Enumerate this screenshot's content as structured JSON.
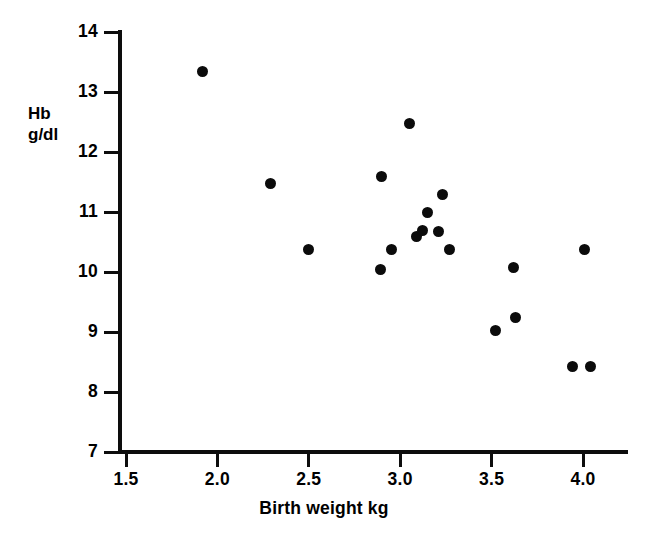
{
  "chart_data": {
    "type": "scatter",
    "title": "",
    "xlabel": "Birth weight kg",
    "ylabel": "Hb\ng/dl",
    "ylabel_lines": [
      "Hb",
      "g/dl"
    ],
    "xlim": [
      1.5,
      4.15
    ],
    "ylim": [
      7,
      14
    ],
    "xticks": [
      1.5,
      2.0,
      2.5,
      3.0,
      3.5,
      4.0
    ],
    "xtick_labels": [
      "1.5",
      "2.0",
      "2.5",
      "3.0",
      "3.5",
      "4.0"
    ],
    "yticks": [
      7,
      8,
      9,
      10,
      11,
      12,
      13,
      14
    ],
    "ytick_labels": [
      "7",
      "8",
      "9",
      "10",
      "11",
      "12",
      "13",
      "14"
    ],
    "grid": false,
    "legend": null,
    "marker": "filled-circle",
    "marker_color": "#0b0b0b",
    "x": [
      1.92,
      2.29,
      2.5,
      2.9,
      2.89,
      2.95,
      3.05,
      3.09,
      3.12,
      3.15,
      3.21,
      3.23,
      3.27,
      3.52,
      3.62,
      3.63,
      3.94,
      4.01,
      4.04
    ],
    "y": [
      13.35,
      11.47,
      10.37,
      11.6,
      10.05,
      10.37,
      12.48,
      10.6,
      10.7,
      11.0,
      10.68,
      11.3,
      10.37,
      9.02,
      10.07,
      9.25,
      8.42,
      10.37,
      8.42
    ],
    "points": [
      {
        "x": 1.92,
        "y": 13.35
      },
      {
        "x": 2.29,
        "y": 11.47
      },
      {
        "x": 2.5,
        "y": 10.37
      },
      {
        "x": 2.9,
        "y": 11.6
      },
      {
        "x": 2.89,
        "y": 10.05
      },
      {
        "x": 2.95,
        "y": 10.37
      },
      {
        "x": 3.05,
        "y": 12.48
      },
      {
        "x": 3.09,
        "y": 10.6
      },
      {
        "x": 3.12,
        "y": 10.7
      },
      {
        "x": 3.15,
        "y": 11.0
      },
      {
        "x": 3.21,
        "y": 10.68
      },
      {
        "x": 3.23,
        "y": 11.3
      },
      {
        "x": 3.27,
        "y": 10.37
      },
      {
        "x": 3.52,
        "y": 9.02
      },
      {
        "x": 3.62,
        "y": 10.07
      },
      {
        "x": 3.63,
        "y": 9.25
      },
      {
        "x": 3.94,
        "y": 8.42
      },
      {
        "x": 4.01,
        "y": 10.37
      },
      {
        "x": 4.04,
        "y": 8.42
      }
    ],
    "n_points": 19
  }
}
